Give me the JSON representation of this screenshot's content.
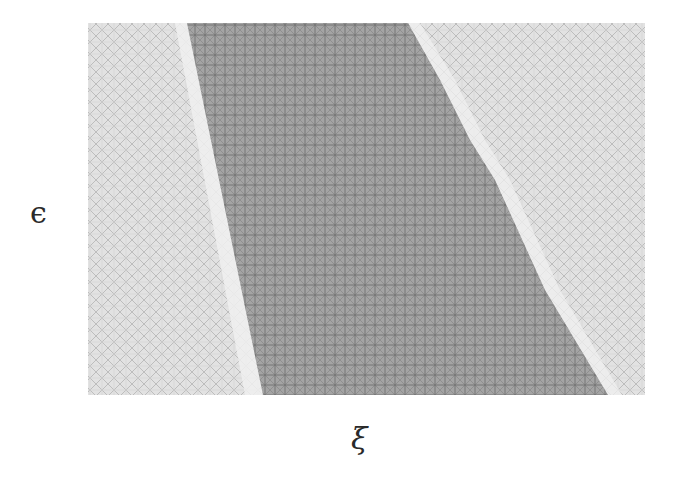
{
  "diagram": {
    "type": "region-plot",
    "axes": {
      "x_label": "ξ",
      "y_label": "ϵ"
    },
    "plot_area": {
      "left": 88,
      "top": 23,
      "right": 645,
      "bottom": 395
    },
    "regions": [
      {
        "name": "left-light-region",
        "shade": "light-crosshatch",
        "fill": "#dcdcdc"
      },
      {
        "name": "central-dark-band",
        "shade": "dark-crosshatch",
        "fill": "#9a9a9a",
        "left_boundary": [
          [
            187,
            23
          ],
          [
            263,
            395
          ]
        ],
        "right_boundary": [
          [
            408,
            23
          ],
          [
            440,
            80
          ],
          [
            470,
            140
          ],
          [
            495,
            180
          ],
          [
            545,
            290
          ],
          [
            608,
            395
          ]
        ]
      },
      {
        "name": "right-light-region",
        "shade": "light-crosshatch",
        "fill": "#dcdcdc"
      }
    ],
    "colors": {
      "background": "#ffffff",
      "light_region": "#dcdcdc",
      "dark_region": "#9a9a9a",
      "hatch_light": "#b8b8b8",
      "hatch_dark": "#6e6e6e",
      "gap_band": "#eeeeee"
    }
  }
}
